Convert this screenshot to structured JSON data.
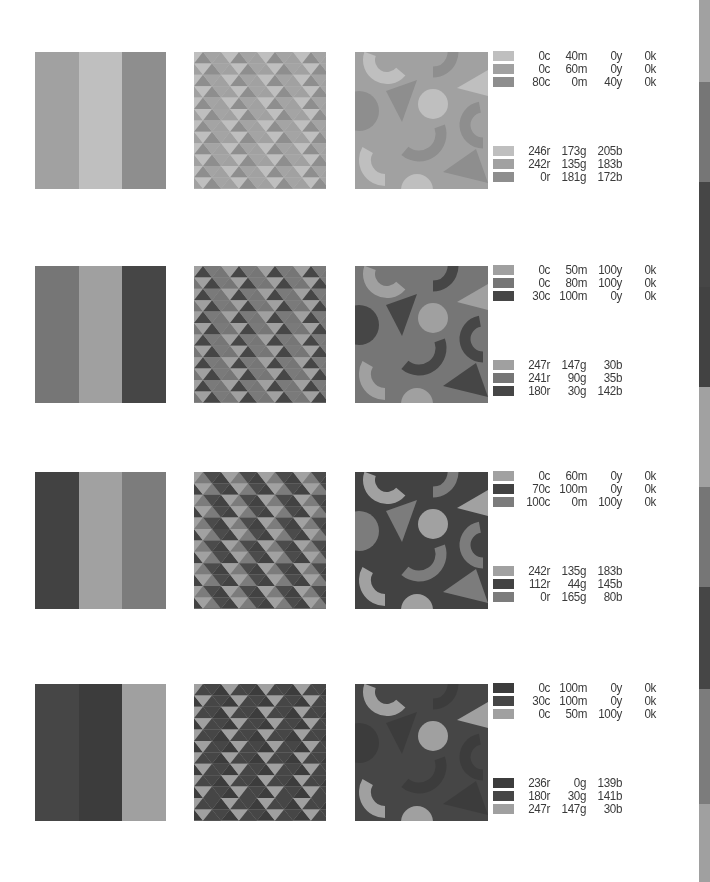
{
  "palettes": [
    {
      "id": "palette-1",
      "top": 52,
      "colors": [
        "#F6ADCD",
        "#F287B7",
        "#00B5AC"
      ],
      "stripe_order": [
        1,
        0,
        2
      ],
      "triangle_colors": {
        "bg": "#F6ADCD",
        "a": "#F287B7",
        "b": "#00B5AC"
      },
      "shape_colors": {
        "bg": "#F287B7",
        "light": "#F6ADCD",
        "dark": "#00B5AC"
      },
      "cmyk": [
        {
          "c": "0c",
          "m": "40m",
          "y": "0y",
          "k": "0k"
        },
        {
          "c": "0c",
          "m": "60m",
          "y": "0y",
          "k": "0k"
        },
        {
          "c": "80c",
          "m": "0m",
          "y": "40y",
          "k": "0k"
        }
      ],
      "rgb": [
        {
          "r": "246r",
          "g": "173g",
          "b": "205b"
        },
        {
          "r": "242r",
          "g": "135g",
          "b": "183b"
        },
        {
          "r": "0r",
          "g": "181g",
          "b": "172b"
        }
      ]
    },
    {
      "id": "palette-2",
      "top": 266,
      "colors": [
        "#F7931E",
        "#F15A23",
        "#B41E8E"
      ],
      "stripe_order": [
        1,
        0,
        2
      ],
      "triangle_colors": {
        "bg": "#F7931E",
        "a": "#F15A23",
        "b": "#B41E8E"
      },
      "shape_colors": {
        "bg": "#F15A23",
        "light": "#F7931E",
        "dark": "#B41E8E"
      },
      "cmyk": [
        {
          "c": "0c",
          "m": "50m",
          "y": "100y",
          "k": "0k"
        },
        {
          "c": "0c",
          "m": "80m",
          "y": "100y",
          "k": "0k"
        },
        {
          "c": "30c",
          "m": "100m",
          "y": "0y",
          "k": "0k"
        }
      ],
      "rgb": [
        {
          "r": "247r",
          "g": "147g",
          "b": "30b"
        },
        {
          "r": "241r",
          "g": "90g",
          "b": "35b"
        },
        {
          "r": "180r",
          "g": "30g",
          "b": "142b"
        }
      ]
    },
    {
      "id": "palette-3",
      "top": 472,
      "colors": [
        "#F287B7",
        "#702C91",
        "#00A550"
      ],
      "stripe_order": [
        1,
        0,
        2
      ],
      "triangle_colors": {
        "bg": "#F287B7",
        "a": "#702C91",
        "b": "#00A550"
      },
      "shape_colors": {
        "bg": "#702C91",
        "light": "#F287B7",
        "dark": "#00A550"
      },
      "cmyk": [
        {
          "c": "0c",
          "m": "60m",
          "y": "0y",
          "k": "0k"
        },
        {
          "c": "70c",
          "m": "100m",
          "y": "0y",
          "k": "0k"
        },
        {
          "c": "100c",
          "m": "0m",
          "y": "100y",
          "k": "0k"
        }
      ],
      "rgb": [
        {
          "r": "242r",
          "g": "135g",
          "b": "183b"
        },
        {
          "r": "112r",
          "g": "44g",
          "b": "145b"
        },
        {
          "r": "0r",
          "g": "165g",
          "b": "80b"
        }
      ]
    },
    {
      "id": "palette-4",
      "top": 684,
      "colors": [
        "#EC008B",
        "#B41E8D",
        "#F7931E"
      ],
      "stripe_order": [
        1,
        0,
        2
      ],
      "triangle_colors": {
        "bg": "#F7931E",
        "a": "#EC008B",
        "b": "#B41E8D"
      },
      "shape_colors": {
        "bg": "#B41E8D",
        "light": "#F7931E",
        "dark": "#EC008B"
      },
      "cmyk": [
        {
          "c": "0c",
          "m": "100m",
          "y": "0y",
          "k": "0k"
        },
        {
          "c": "30c",
          "m": "100m",
          "y": "0y",
          "k": "0k"
        },
        {
          "c": "0c",
          "m": "50m",
          "y": "100y",
          "k": "0k"
        }
      ],
      "rgb": [
        {
          "r": "236r",
          "g": "0g",
          "b": "139b"
        },
        {
          "r": "180r",
          "g": "30g",
          "b": "141b"
        },
        {
          "r": "247r",
          "g": "147g",
          "b": "30b"
        }
      ]
    }
  ],
  "edge_strip": [
    {
      "color": "#F287B7",
      "height": 82
    },
    {
      "color": "#F15A23",
      "height": 100
    },
    {
      "color": "#B41E8E",
      "height": 105
    },
    {
      "color": "#702C91",
      "height": 100
    },
    {
      "color": "#F287B7",
      "height": 100
    },
    {
      "color": "#F15A23",
      "height": 100
    },
    {
      "color": "#B41E8D",
      "height": 102
    },
    {
      "color": "#00A550",
      "height": 115
    },
    {
      "color": "#F7931E",
      "height": 78
    }
  ]
}
